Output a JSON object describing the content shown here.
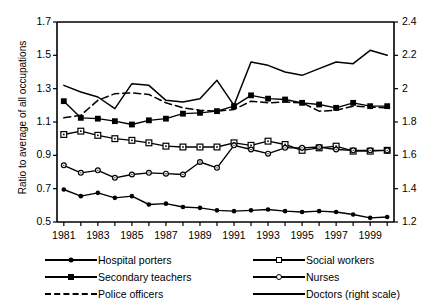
{
  "chart_data": {
    "type": "line",
    "title": "",
    "xlabel": "",
    "ylabel": "Ratio to average of all occupations",
    "ylabel_right": "",
    "x": [
      1981,
      1982,
      1983,
      1984,
      1985,
      1986,
      1987,
      1988,
      1989,
      1990,
      1991,
      1992,
      1993,
      1994,
      1995,
      1996,
      1997,
      1998,
      1999,
      2000
    ],
    "xlim": [
      1980.6,
      2000.4
    ],
    "xticks": [
      1981,
      1982,
      1983,
      1984,
      1985,
      1986,
      1987,
      1988,
      1989,
      1990,
      1991,
      1992,
      1993,
      1994,
      1995,
      1996,
      1997,
      1998,
      1999,
      2000
    ],
    "xticklabels": [
      "1981",
      "",
      "1983",
      "",
      "1985",
      "",
      "1987",
      "",
      "1989",
      "",
      "1991",
      "",
      "1993",
      "",
      "1995",
      "",
      "1997",
      "",
      "1999",
      ""
    ],
    "ylim": [
      0.5,
      1.7
    ],
    "yticks": [
      0.5,
      0.7,
      0.9,
      1.1,
      1.3,
      1.5,
      1.7
    ],
    "yticklabels": [
      "0.5",
      "0.7",
      "0.9",
      "1.1",
      "1.3",
      "1.5",
      "1.7"
    ],
    "ylim_right": [
      1.2,
      2.4
    ],
    "yticks_right": [
      1.2,
      1.4,
      1.6,
      1.8,
      2.0,
      2.2,
      2.4
    ],
    "yticklabels_right": [
      "1.2",
      "1.4",
      "1.6",
      "1.8",
      "2",
      "2.2",
      "2.4"
    ],
    "grid": false,
    "legend_position": "bottom",
    "series": [
      {
        "name": "Hospital porters",
        "axis": "left",
        "marker": "filled-circle",
        "linestyle": "solid",
        "values": [
          0.695,
          0.655,
          0.675,
          0.645,
          0.655,
          0.605,
          0.61,
          0.59,
          0.585,
          0.57,
          0.565,
          0.57,
          0.575,
          0.565,
          0.56,
          0.565,
          0.56,
          0.545,
          0.525,
          0.53
        ]
      },
      {
        "name": "Secondary teachers",
        "axis": "left",
        "marker": "filled-square",
        "linestyle": "solid",
        "values": [
          1.225,
          1.125,
          1.12,
          1.105,
          1.085,
          1.11,
          1.12,
          1.15,
          1.155,
          1.165,
          1.195,
          1.26,
          1.24,
          1.235,
          1.215,
          1.205,
          1.185,
          1.215,
          1.195,
          1.195
        ]
      },
      {
        "name": "Police officers",
        "axis": "left",
        "marker": "none",
        "linestyle": "dashed",
        "values": [
          1.125,
          1.14,
          1.23,
          1.27,
          1.275,
          1.265,
          1.215,
          1.185,
          1.17,
          1.165,
          1.175,
          1.225,
          1.215,
          1.22,
          1.215,
          1.165,
          1.17,
          1.195,
          1.19,
          1.185
        ]
      },
      {
        "name": "Social workers",
        "axis": "left",
        "marker": "open-square",
        "linestyle": "solid",
        "values": [
          1.025,
          1.045,
          1.02,
          1.0,
          0.99,
          0.975,
          0.955,
          0.95,
          0.95,
          0.95,
          0.975,
          0.96,
          0.985,
          0.965,
          0.93,
          0.945,
          0.955,
          0.925,
          0.925,
          0.93
        ]
      },
      {
        "name": "Nurses",
        "axis": "left",
        "marker": "open-circle",
        "linestyle": "solid",
        "values": [
          0.84,
          0.795,
          0.81,
          0.765,
          0.785,
          0.795,
          0.79,
          0.785,
          0.86,
          0.825,
          0.96,
          0.935,
          0.91,
          0.945,
          0.945,
          0.95,
          0.935,
          0.93,
          0.93,
          0.93
        ]
      },
      {
        "name": "Doctors (right scale)",
        "axis": "right",
        "marker": "none",
        "linestyle": "solid",
        "values": [
          2.02,
          1.98,
          1.95,
          1.88,
          2.03,
          2.02,
          1.93,
          1.92,
          1.94,
          2.05,
          1.9,
          2.16,
          2.14,
          2.1,
          2.08,
          2.12,
          2.16,
          2.15,
          2.23,
          2.2
        ]
      }
    ]
  },
  "legend": {
    "items": [
      {
        "label": "Hospital porters",
        "marker": "filled-circle",
        "style": "solid"
      },
      {
        "label": "Secondary teachers",
        "marker": "filled-square",
        "style": "solid"
      },
      {
        "label": "Police officers",
        "marker": "none",
        "style": "dashed"
      },
      {
        "label": "Social workers",
        "marker": "open-square",
        "style": "solid"
      },
      {
        "label": "Nurses",
        "marker": "open-circle",
        "style": "solid"
      },
      {
        "label": "Doctors (right scale)",
        "marker": "none",
        "style": "solid"
      }
    ]
  }
}
